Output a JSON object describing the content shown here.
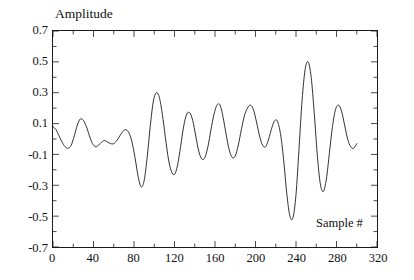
{
  "chart_data": {
    "type": "line",
    "title": "",
    "xlabel": "Sample #",
    "ylabel": "Amplitude",
    "xlim": [
      0,
      320
    ],
    "ylim": [
      -0.7,
      0.7
    ],
    "grid": false,
    "legend": null,
    "line_color": "#1a1a1a",
    "frame_color": "#1a1a1a",
    "background": "#ffffff",
    "x_ticks": [
      0,
      40,
      80,
      120,
      160,
      200,
      240,
      280,
      320
    ],
    "x_tick_labels": [
      "0",
      "40",
      "80",
      "120",
      "160",
      "200",
      "240",
      "280",
      "320"
    ],
    "x_minor_step": 20,
    "y_ticks": [
      0.7,
      0.5,
      0.3,
      0.1,
      -0.1,
      -0.3,
      -0.5,
      -0.7
    ],
    "y_tick_labels": [
      "0.7",
      "0.5",
      "0.3",
      "0.1",
      "-0.1",
      "-0.3",
      "-0.5",
      "-0.7"
    ],
    "y_minor_step": 0.1,
    "series": [
      {
        "name": "signal",
        "x": [
          0,
          3,
          6,
          9,
          12,
          15,
          18,
          21,
          24,
          27,
          30,
          33,
          36,
          39,
          42,
          45,
          48,
          51,
          54,
          57,
          60,
          63,
          66,
          69,
          72,
          75,
          78,
          81,
          84,
          87,
          90,
          93,
          96,
          99,
          102,
          105,
          108,
          111,
          114,
          117,
          120,
          123,
          126,
          129,
          132,
          135,
          138,
          141,
          144,
          147,
          150,
          153,
          156,
          159,
          162,
          165,
          168,
          171,
          174,
          177,
          180,
          183,
          186,
          189,
          192,
          195,
          198,
          201,
          204,
          207,
          210,
          213,
          216,
          219,
          222,
          225,
          228,
          231,
          234,
          237,
          240,
          243,
          246,
          249,
          252,
          255,
          258,
          261,
          264,
          267,
          270,
          273,
          276,
          279,
          282,
          285,
          288,
          291,
          294,
          297,
          300
        ],
        "y": [
          0.08,
          0.06,
          0.02,
          -0.02,
          -0.05,
          -0.06,
          -0.04,
          0.02,
          0.09,
          0.13,
          0.12,
          0.08,
          0.02,
          -0.03,
          -0.05,
          -0.04,
          -0.02,
          -0.01,
          -0.02,
          -0.03,
          -0.03,
          -0.01,
          0.02,
          0.05,
          0.06,
          0.04,
          -0.02,
          -0.12,
          -0.24,
          -0.31,
          -0.27,
          -0.12,
          0.08,
          0.24,
          0.3,
          0.27,
          0.16,
          0.01,
          -0.13,
          -0.21,
          -0.23,
          -0.17,
          -0.05,
          0.08,
          0.16,
          0.17,
          0.12,
          0.02,
          -0.08,
          -0.13,
          -0.12,
          -0.05,
          0.06,
          0.16,
          0.22,
          0.22,
          0.14,
          0.03,
          -0.07,
          -0.12,
          -0.11,
          -0.04,
          0.06,
          0.15,
          0.2,
          0.22,
          0.19,
          0.11,
          0.02,
          -0.04,
          -0.05,
          0.0,
          0.07,
          0.12,
          0.11,
          0.02,
          -0.15,
          -0.36,
          -0.5,
          -0.51,
          -0.36,
          -0.06,
          0.25,
          0.45,
          0.5,
          0.4,
          0.17,
          -0.1,
          -0.29,
          -0.34,
          -0.26,
          -0.09,
          0.08,
          0.19,
          0.22,
          0.18,
          0.09,
          0.0,
          -0.05,
          -0.06,
          -0.03
        ]
      }
    ],
    "annotations": {
      "max_value": 0.69,
      "max_sample": 232,
      "min_value": -0.68,
      "min_sample": 222,
      "data_end_sample": 300
    }
  },
  "axis_titles": {
    "y": "Amplitude",
    "x": "Sample #"
  }
}
